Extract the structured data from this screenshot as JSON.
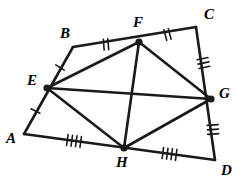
{
  "figure": {
    "type": "geometry-diagram",
    "width": 242,
    "height": 187,
    "background_color": "#ffffff",
    "stroke_color": "#1a1a1a",
    "label_color": "#000000",
    "outer_stroke_width": 2.6,
    "inner_stroke_width": 2.6,
    "tick_stroke_width": 1.6,
    "vertex_dot_radius": 3.6
  },
  "points": {
    "A": {
      "label": "A",
      "x": 24,
      "y": 134,
      "dot": false,
      "label_x": 6,
      "label_y": 131
    },
    "B": {
      "label": "B",
      "x": 73,
      "y": 47,
      "dot": false,
      "label_x": 60,
      "label_y": 26
    },
    "C": {
      "label": "C",
      "x": 196,
      "y": 27,
      "dot": false,
      "label_x": 204,
      "label_y": 7
    },
    "D": {
      "label": "D",
      "x": 215,
      "y": 160,
      "dot": false,
      "label_x": 221,
      "label_y": 163
    },
    "E": {
      "label": "E",
      "x": 47,
      "y": 88,
      "dot": true,
      "label_x": 27,
      "label_y": 73
    },
    "F": {
      "label": "F",
      "x": 139,
      "y": 42,
      "dot": true,
      "label_x": 133,
      "label_y": 15
    },
    "G": {
      "label": "G",
      "x": 211,
      "y": 99,
      "dot": true,
      "label_x": 219,
      "label_y": 86
    },
    "H": {
      "label": "H",
      "x": 124,
      "y": 148,
      "dot": true,
      "label_x": 116,
      "label_y": 155
    }
  },
  "outer_edges": [
    {
      "name": "A-B",
      "from": "A",
      "to": "B",
      "via": "E"
    },
    {
      "name": "B-C",
      "from": "B",
      "to": "C",
      "via": "F"
    },
    {
      "name": "C-D",
      "from": "C",
      "to": "D",
      "via": "G"
    },
    {
      "name": "D-A",
      "from": "D",
      "to": "A",
      "via": "H"
    }
  ],
  "inner_edges": [
    {
      "name": "E-F",
      "from": "E",
      "to": "F"
    },
    {
      "name": "F-G",
      "from": "F",
      "to": "G"
    },
    {
      "name": "G-H",
      "from": "G",
      "to": "H"
    },
    {
      "name": "H-E",
      "from": "H",
      "to": "E"
    },
    {
      "name": "E-G",
      "from": "E",
      "to": "G"
    },
    {
      "name": "F-H",
      "from": "F",
      "to": "H"
    }
  ],
  "tick_marks": [
    {
      "name": "tick-EB",
      "segment": "E-B",
      "count": 1,
      "length": 10,
      "spacing": 4
    },
    {
      "name": "tick-AE",
      "segment": "A-E",
      "count": 1,
      "length": 10,
      "spacing": 4
    },
    {
      "name": "tick-BF",
      "segment": "B-F",
      "count": 2,
      "length": 11,
      "spacing": 4.5
    },
    {
      "name": "tick-FC",
      "segment": "F-C",
      "count": 2,
      "length": 11,
      "spacing": 4.5
    },
    {
      "name": "tick-CG",
      "segment": "C-G",
      "count": 3,
      "length": 11,
      "spacing": 4.5
    },
    {
      "name": "tick-GD",
      "segment": "G-D",
      "count": 3,
      "length": 11,
      "spacing": 4.5
    },
    {
      "name": "tick-AH",
      "segment": "A-H",
      "count": 4,
      "length": 11,
      "spacing": 4.5
    },
    {
      "name": "tick-HD",
      "segment": "H-D",
      "count": 4,
      "length": 11,
      "spacing": 4.5
    }
  ]
}
